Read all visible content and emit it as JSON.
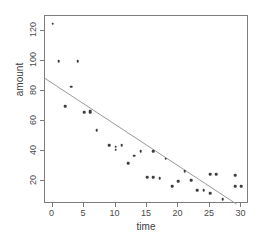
{
  "chart_data": {
    "type": "scatter",
    "title": "",
    "xlabel": "time",
    "ylabel": "amount",
    "xlim": [
      -1.2,
      31.2
    ],
    "ylim": [
      5,
      130
    ],
    "grid": false,
    "legend": "none",
    "xticks": [
      0,
      5,
      10,
      15,
      20,
      25,
      30
    ],
    "yticks": [
      20,
      40,
      60,
      80,
      100,
      120
    ],
    "xtick_labels": [
      "0",
      "5",
      "10",
      "15",
      "20",
      "25",
      "30"
    ],
    "ytick_labels": [
      "20",
      "40",
      "60",
      "80",
      "100",
      "120"
    ],
    "point_color": "#3d3d3d",
    "line_color": "#9a9a9a",
    "frame_color": "#7d7d7d",
    "x": [
      0,
      1,
      2,
      3,
      4,
      5,
      6,
      6,
      7,
      9,
      10,
      10,
      11,
      12,
      13,
      14,
      15,
      16,
      16,
      17,
      18,
      19,
      20,
      21,
      22,
      23,
      24,
      25,
      25,
      26,
      27,
      29,
      29,
      30
    ],
    "y": [
      125,
      100,
      70,
      83,
      100,
      66,
      67,
      66,
      54,
      44,
      41,
      43,
      44,
      32,
      37,
      40,
      23,
      40,
      23,
      22,
      35,
      17,
      20,
      27,
      21,
      14,
      14,
      12,
      25,
      25,
      8,
      24,
      17,
      17
    ],
    "points": [
      {
        "x": 0,
        "y": 125
      },
      {
        "x": 1,
        "y": 100
      },
      {
        "x": 2,
        "y": 70
      },
      {
        "x": 3,
        "y": 83
      },
      {
        "x": 4,
        "y": 100
      },
      {
        "x": 5,
        "y": 66
      },
      {
        "x": 6,
        "y": 67
      },
      {
        "x": 6,
        "y": 66
      },
      {
        "x": 7,
        "y": 54
      },
      {
        "x": 9,
        "y": 44
      },
      {
        "x": 10,
        "y": 41
      },
      {
        "x": 10,
        "y": 43
      },
      {
        "x": 11,
        "y": 44
      },
      {
        "x": 12,
        "y": 32
      },
      {
        "x": 13,
        "y": 37
      },
      {
        "x": 14,
        "y": 40
      },
      {
        "x": 15,
        "y": 23
      },
      {
        "x": 16,
        "y": 40
      },
      {
        "x": 16,
        "y": 23
      },
      {
        "x": 17,
        "y": 22
      },
      {
        "x": 18,
        "y": 35
      },
      {
        "x": 19,
        "y": 17
      },
      {
        "x": 20,
        "y": 20
      },
      {
        "x": 21,
        "y": 27
      },
      {
        "x": 22,
        "y": 21
      },
      {
        "x": 23,
        "y": 14
      },
      {
        "x": 24,
        "y": 14
      },
      {
        "x": 25,
        "y": 12
      },
      {
        "x": 25,
        "y": 25
      },
      {
        "x": 26,
        "y": 25
      },
      {
        "x": 27,
        "y": 8
      },
      {
        "x": 29,
        "y": 24
      },
      {
        "x": 29,
        "y": 17
      },
      {
        "x": 30,
        "y": 17
      }
    ],
    "trend_line": {
      "type": "linear-fit",
      "x0": -1.2,
      "y0": 88.5,
      "x1": 29.2,
      "y1": 5.0
    }
  }
}
